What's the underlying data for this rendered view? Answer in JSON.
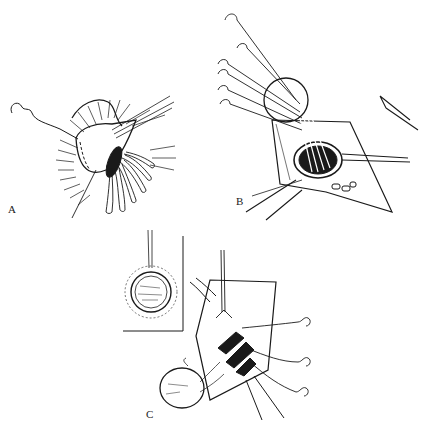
{
  "figure": {
    "panels": [
      {
        "id": "A",
        "label": "A",
        "description": "Everted stoma with radiating sutures and suture needle"
      },
      {
        "id": "B",
        "label": "B",
        "description": "Multiple sutures placed through opening with retractors"
      },
      {
        "id": "C",
        "label": "C",
        "description": "Sutures tied with inset showing circular closure"
      }
    ],
    "colors": {
      "ink": "#1a1a1a",
      "background": "#ffffff"
    }
  }
}
